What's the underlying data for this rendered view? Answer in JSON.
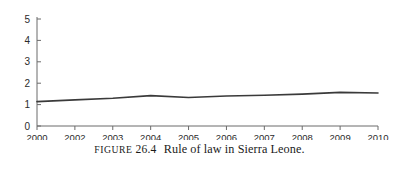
{
  "caption": {
    "figure_word": "Figure",
    "figure_number": "26.4",
    "text": "Rule of law in Sierra Leone."
  },
  "colors": {
    "line": "#3a3a3a",
    "axis": "#6b6b6b",
    "text": "#2b2b2b",
    "background": "#ffffff"
  },
  "chart_data": {
    "type": "line",
    "title": "",
    "xlabel": "",
    "ylabel": "",
    "categories": [
      "2000",
      "2002",
      "2003",
      "2004",
      "2005",
      "2006",
      "2007",
      "2008",
      "2009",
      "2010"
    ],
    "values": [
      1.14,
      1.22,
      1.3,
      1.42,
      1.33,
      1.4,
      1.44,
      1.49,
      1.57,
      1.54
    ],
    "series": [
      {
        "name": "Rule of law",
        "values": [
          1.14,
          1.22,
          1.3,
          1.42,
          1.33,
          1.4,
          1.44,
          1.49,
          1.57,
          1.54
        ]
      }
    ],
    "ylim": [
      0,
      5
    ],
    "yticks": [
      "0",
      "1",
      "2",
      "3",
      "4",
      "5"
    ],
    "grid": false,
    "legend": "none"
  }
}
